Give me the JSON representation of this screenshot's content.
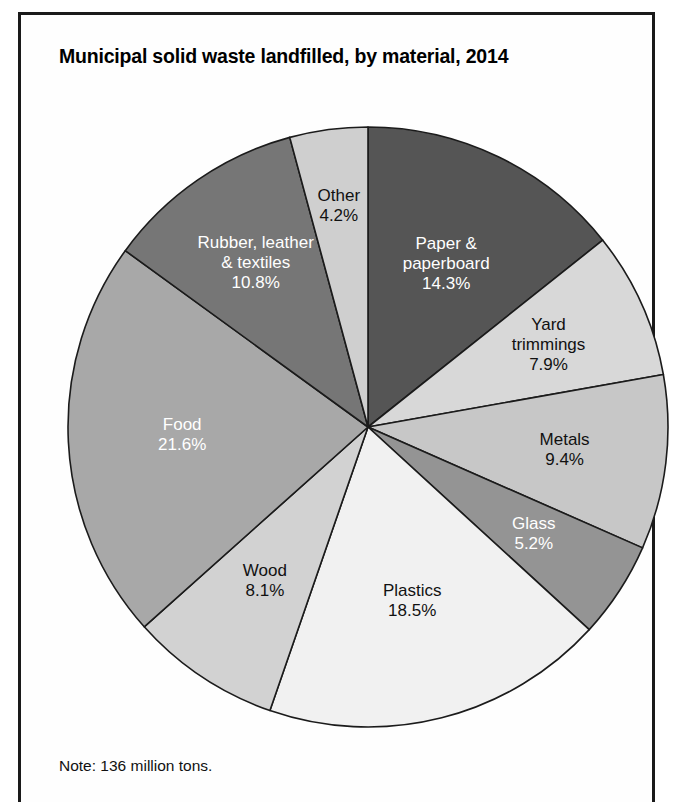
{
  "figure": {
    "title": "Municipal solid waste landfilled, by material, 2014",
    "note": "Note: 136 million tons.",
    "border_color": "#1a1a1a",
    "background_color": "#ffffff"
  },
  "chart_data": {
    "type": "pie",
    "title": "Municipal solid waste landfilled, by material, 2014",
    "subtitle": "",
    "note": "Note: 136 million tons.",
    "total_label": "136 million tons",
    "unit": "percent",
    "legend": "none (labels drawn inside slices)",
    "start_angle_deg": 0,
    "direction": "clockwise",
    "categories": [
      "Paper & paperboard",
      "Yard trimmings",
      "Metals",
      "Glass",
      "Plastics",
      "Wood",
      "Food",
      "Rubber, leather & textiles",
      "Other"
    ],
    "values": [
      14.3,
      7.9,
      9.4,
      5.2,
      18.5,
      8.1,
      21.6,
      10.8,
      4.2
    ],
    "slices": [
      {
        "name": "Paper & paperboard",
        "label_lines": [
          "Paper &",
          "paperboard"
        ],
        "value": 14.3,
        "value_label": "14.3%",
        "color": "#555555",
        "text_color": "#ffffff",
        "label_r": 0.6
      },
      {
        "name": "Yard trimmings",
        "label_lines": [
          "Yard",
          "trimmings"
        ],
        "value": 7.9,
        "value_label": "7.9%",
        "color": "#d8d8d8",
        "text_color": "#111111",
        "label_r": 0.66
      },
      {
        "name": "Metals",
        "label_lines": [
          "Metals"
        ],
        "value": 9.4,
        "value_label": "9.4%",
        "color": "#c7c7c7",
        "text_color": "#111111",
        "label_r": 0.66
      },
      {
        "name": "Glass",
        "label_lines": [
          "Glass"
        ],
        "value": 5.2,
        "value_label": "5.2%",
        "color": "#949494",
        "text_color": "#ffffff",
        "label_r": 0.66
      },
      {
        "name": "Plastics",
        "label_lines": [
          "Plastics"
        ],
        "value": 18.5,
        "value_label": "18.5%",
        "color": "#f1f1f1",
        "text_color": "#111111",
        "label_r": 0.6
      },
      {
        "name": "Wood",
        "label_lines": [
          "Wood"
        ],
        "value": 8.1,
        "value_label": "8.1%",
        "color": "#d2d2d2",
        "text_color": "#111111",
        "label_r": 0.62
      },
      {
        "name": "Food",
        "label_lines": [
          "Food"
        ],
        "value": 21.6,
        "value_label": "21.6%",
        "color": "#a8a8a8",
        "text_color": "#ffffff",
        "label_r": 0.62
      },
      {
        "name": "Rubber, leather & textiles",
        "label_lines": [
          "Rubber, leather",
          "& textiles"
        ],
        "value": 10.8,
        "value_label": "10.8%",
        "color": "#767676",
        "text_color": "#ffffff",
        "label_r": 0.66
      },
      {
        "name": "Other",
        "label_lines": [
          "Other"
        ],
        "value": 4.2,
        "value_label": "4.2%",
        "color": "#cfcfcf",
        "text_color": "#111111",
        "label_r": 0.74
      }
    ]
  }
}
